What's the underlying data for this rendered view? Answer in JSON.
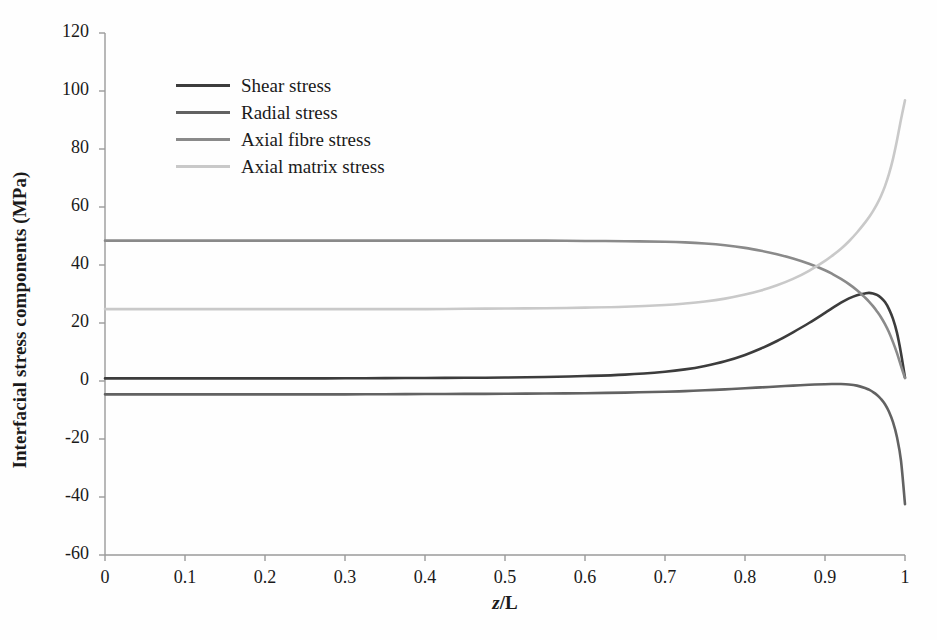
{
  "chart_data": {
    "type": "line",
    "title": "",
    "xlabel": "z/L",
    "ylabel": "Interfacial stress components (MPa)",
    "xlim": [
      0,
      1
    ],
    "ylim": [
      -60,
      120
    ],
    "xticks": [
      "0",
      "0.1",
      "0.2",
      "0.3",
      "0.4",
      "0.5",
      "0.6",
      "0.7",
      "0.8",
      "0.9",
      "1"
    ],
    "xtick_values": [
      0,
      0.1,
      0.2,
      0.3,
      0.4,
      0.5,
      0.6,
      0.7,
      0.8,
      0.9,
      1
    ],
    "yticks": [
      "120",
      "100",
      "80",
      "60",
      "40",
      "20",
      "0",
      "-20",
      "-40",
      "-60"
    ],
    "ytick_values": [
      120,
      100,
      80,
      60,
      40,
      20,
      0,
      -20,
      -40,
      -60
    ],
    "grid": false,
    "legend_position": "upper-left-inside",
    "x": [
      0,
      0.05,
      0.1,
      0.15,
      0.2,
      0.25,
      0.3,
      0.35,
      0.4,
      0.45,
      0.5,
      0.55,
      0.6,
      0.65,
      0.7,
      0.725,
      0.75,
      0.775,
      0.8,
      0.82,
      0.84,
      0.86,
      0.88,
      0.9,
      0.91,
      0.92,
      0.93,
      0.94,
      0.95,
      0.955,
      0.96,
      0.965,
      0.97,
      0.975,
      0.98,
      0.985,
      0.99,
      0.995,
      1
    ],
    "series": [
      {
        "name": "Shear stress",
        "color": "#3c3c3c",
        "width": 2.6,
        "values": [
          0.9,
          0.9,
          0.9,
          0.9,
          0.9,
          0.9,
          0.95,
          1.0,
          1.05,
          1.1,
          1.2,
          1.4,
          1.7,
          2.2,
          3.2,
          4.0,
          5.2,
          6.8,
          9.0,
          11.2,
          13.8,
          16.8,
          20.0,
          23.5,
          25.3,
          27.0,
          28.5,
          29.6,
          30.2,
          30.4,
          30.2,
          29.7,
          28.7,
          27.2,
          24.8,
          21.4,
          16.6,
          9.6,
          1.2
        ]
      },
      {
        "name": "Radial stress",
        "color": "#626262",
        "width": 2.6,
        "values": [
          -4.6,
          -4.6,
          -4.6,
          -4.6,
          -4.6,
          -4.6,
          -4.6,
          -4.55,
          -4.5,
          -4.45,
          -4.4,
          -4.3,
          -4.2,
          -4.0,
          -3.7,
          -3.5,
          -3.2,
          -2.9,
          -2.5,
          -2.2,
          -1.9,
          -1.6,
          -1.3,
          -1.1,
          -1.05,
          -1.05,
          -1.2,
          -1.6,
          -2.4,
          -3.0,
          -3.8,
          -4.8,
          -6.2,
          -8.0,
          -10.6,
          -14.2,
          -19.4,
          -27.5,
          -42.5
        ]
      },
      {
        "name": "Axial fibre stress",
        "color": "#8a8a8a",
        "width": 2.6,
        "values": [
          48.4,
          48.4,
          48.4,
          48.4,
          48.4,
          48.4,
          48.4,
          48.4,
          48.4,
          48.4,
          48.4,
          48.4,
          48.3,
          48.2,
          48.0,
          47.8,
          47.4,
          46.8,
          45.9,
          44.9,
          43.7,
          42.2,
          40.4,
          38.2,
          36.8,
          35.2,
          33.4,
          31.3,
          28.8,
          27.4,
          25.8,
          24.0,
          22.0,
          19.6,
          16.8,
          13.4,
          9.6,
          5.2,
          1.0
        ]
      },
      {
        "name": "Axial matrix stress",
        "color": "#c9c9c9",
        "width": 2.6,
        "values": [
          24.8,
          24.8,
          24.8,
          24.8,
          24.8,
          24.8,
          24.8,
          24.8,
          24.8,
          24.9,
          25.0,
          25.1,
          25.3,
          25.6,
          26.2,
          26.7,
          27.4,
          28.4,
          29.8,
          31.2,
          33.0,
          35.2,
          38.0,
          41.4,
          43.4,
          45.6,
          48.2,
          51.2,
          54.6,
          56.5,
          58.6,
          61.0,
          63.8,
          67.2,
          71.4,
          76.6,
          83.0,
          90.2,
          96.8
        ]
      }
    ]
  },
  "axis": {
    "xlabel_text": "z",
    "xlabel_rest": "/L",
    "ylabel_text": "Interfacial stress components (MPa)"
  }
}
